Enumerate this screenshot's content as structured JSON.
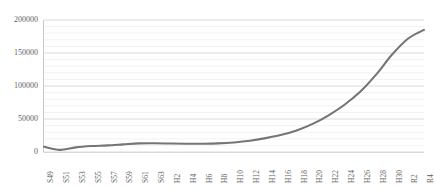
{
  "chart_data": {
    "type": "line",
    "title": "",
    "subtitle": "",
    "xlabel": "",
    "ylabel": "",
    "ylim": [
      0,
      200000
    ],
    "ytick_labels": [
      "0",
      "50000",
      "100000",
      "150000",
      "200000"
    ],
    "ytick_values": [
      0,
      50000,
      100000,
      150000,
      200000
    ],
    "grid": true,
    "grid_minor": true,
    "legend": false,
    "legend_position": "none",
    "line_color": "#757575",
    "categories": [
      "S49",
      "S51",
      "S53",
      "S55",
      "S57",
      "S59",
      "S61",
      "S63",
      "H2",
      "H4",
      "H6",
      "H8",
      "H10",
      "H12",
      "H14",
      "H16",
      "H18",
      "H20",
      "H22",
      "H24",
      "H26",
      "H28",
      "H30",
      "R2",
      "R4"
    ],
    "values": [
      8000,
      3200,
      7000,
      9000,
      10000,
      11500,
      13000,
      13200,
      12800,
      12500,
      12500,
      13000,
      14500,
      17000,
      21000,
      26000,
      33000,
      43000,
      56000,
      72000,
      92000,
      118000,
      148000,
      172000,
      185000
    ],
    "series": [
      {
        "name": "series-1",
        "color": "#757575",
        "values": [
          8000,
          3200,
          7000,
          9000,
          10000,
          11500,
          13000,
          13200,
          12800,
          12500,
          12500,
          13000,
          14500,
          17000,
          21000,
          26000,
          33000,
          43000,
          56000,
          72000,
          92000,
          118000,
          148000,
          172000,
          185000
        ]
      }
    ]
  }
}
